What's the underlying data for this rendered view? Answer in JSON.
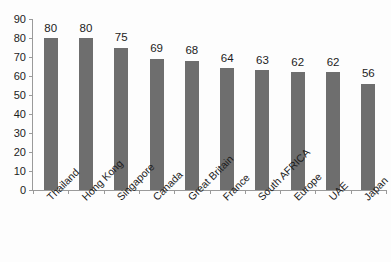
{
  "chart_data": {
    "type": "bar",
    "title": "",
    "subtitle": "",
    "xlabel": "",
    "ylabel": "",
    "ylim": [
      0,
      90
    ],
    "ytick_step": 10,
    "yticks": [
      0,
      10,
      20,
      30,
      40,
      50,
      60,
      70,
      80,
      90
    ],
    "grid": false,
    "legend": false,
    "legend_position": "none",
    "bar_color": "#6e6e6e",
    "axis_color": "#9a9a9a",
    "text_color": "#1c1c1c",
    "data_labels_shown": true,
    "categories": [
      "Thailand",
      "Hong Kong",
      "Singapore",
      "Canada",
      "Great Britain",
      "France",
      "South AFRICA",
      "Europe",
      "UAE",
      "Japan"
    ],
    "values": [
      80,
      80,
      75,
      69,
      68,
      64,
      63,
      62,
      62,
      56
    ]
  }
}
